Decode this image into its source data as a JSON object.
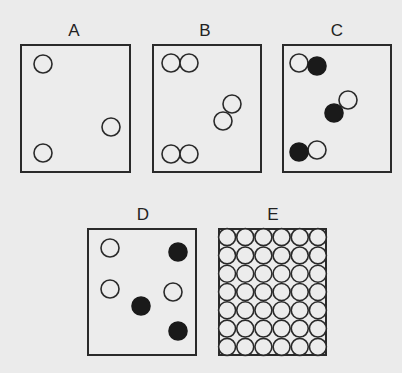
{
  "figure": {
    "background": "#ebebeb",
    "stroke_color": "#2a2a2a",
    "fill_black": "#1a1a1a",
    "fill_white": "#ececec",
    "circle_radius": 9,
    "panels": [
      {
        "label": "A",
        "box": {
          "x": 20,
          "y": 44,
          "w": 111,
          "h": 129
        },
        "label_pos": {
          "x": 74,
          "y": 22
        },
        "circles": [
          {
            "cx": 43,
            "cy": 64,
            "fill": "white"
          },
          {
            "cx": 111,
            "cy": 127,
            "fill": "white"
          },
          {
            "cx": 43,
            "cy": 153,
            "fill": "white"
          }
        ]
      },
      {
        "label": "B",
        "box": {
          "x": 152,
          "y": 44,
          "w": 110,
          "h": 129
        },
        "label_pos": {
          "x": 205,
          "y": 22
        },
        "circles": [
          {
            "cx": 171,
            "cy": 63,
            "fill": "white"
          },
          {
            "cx": 189,
            "cy": 63,
            "fill": "white"
          },
          {
            "cx": 232,
            "cy": 104,
            "fill": "white"
          },
          {
            "cx": 223,
            "cy": 121,
            "fill": "white"
          },
          {
            "cx": 171,
            "cy": 154,
            "fill": "white"
          },
          {
            "cx": 189,
            "cy": 154,
            "fill": "white"
          }
        ]
      },
      {
        "label": "C",
        "box": {
          "x": 282,
          "y": 44,
          "w": 110,
          "h": 129
        },
        "label_pos": {
          "x": 337,
          "y": 22
        },
        "circles": [
          {
            "cx": 299,
            "cy": 63,
            "fill": "white"
          },
          {
            "cx": 317,
            "cy": 66,
            "fill": "black"
          },
          {
            "cx": 348,
            "cy": 100,
            "fill": "white"
          },
          {
            "cx": 334,
            "cy": 113,
            "fill": "black"
          },
          {
            "cx": 317,
            "cy": 150,
            "fill": "white"
          },
          {
            "cx": 299,
            "cy": 152,
            "fill": "black"
          }
        ]
      },
      {
        "label": "D",
        "box": {
          "x": 87,
          "y": 228,
          "w": 110,
          "h": 128
        },
        "label_pos": {
          "x": 143,
          "y": 206
        },
        "circles": [
          {
            "cx": 110,
            "cy": 248,
            "fill": "white"
          },
          {
            "cx": 178,
            "cy": 252,
            "fill": "black"
          },
          {
            "cx": 110,
            "cy": 289,
            "fill": "white"
          },
          {
            "cx": 173,
            "cy": 292,
            "fill": "white"
          },
          {
            "cx": 141,
            "cy": 306,
            "fill": "black"
          },
          {
            "cx": 178,
            "cy": 331,
            "fill": "black"
          }
        ]
      },
      {
        "label": "E",
        "box": {
          "x": 218,
          "y": 228,
          "w": 109,
          "h": 128
        },
        "label_pos": {
          "x": 273,
          "y": 206
        },
        "grid": {
          "cols": 6,
          "rows": 7,
          "fill": "white"
        }
      }
    ]
  }
}
